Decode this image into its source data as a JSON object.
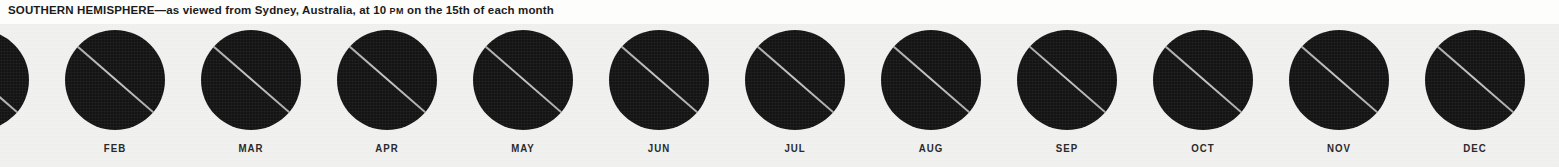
{
  "header": {
    "region_label": "SOUTHERN HEMISPHERE",
    "dash": "—",
    "caption_lead": "SOUTHERN HEMISPHERE—as viewed from Sydney, Australia, at 10 ",
    "caption_smallcaps": "PM",
    "caption_tail": " on the 15th of each month",
    "full_caption": "SOUTHERN HEMISPHERE—as viewed from Sydney, Australia, at 10 PM on the 15th of each month",
    "observer_city": "Sydney, Australia",
    "observation_time": "10 PM",
    "observation_day": "15th of each month"
  },
  "colors": {
    "page_background": "#fdfdfc",
    "field_background": "#f1f1ef",
    "sky_disk": "#141414",
    "galactic_band": "#cdcdcd",
    "label_text": "#2a2a2a",
    "caption_text": "#1b1b1b"
  },
  "charts": {
    "count": 12,
    "disk_diameter_px": 100,
    "cell_pitch_px": 136,
    "months": [
      {
        "label": "JAN",
        "index": 1,
        "clipped": "left"
      },
      {
        "label": "FEB",
        "index": 2,
        "clipped": "none"
      },
      {
        "label": "MAR",
        "index": 3,
        "clipped": "none"
      },
      {
        "label": "APR",
        "index": 4,
        "clipped": "none"
      },
      {
        "label": "MAY",
        "index": 5,
        "clipped": "none"
      },
      {
        "label": "JUN",
        "index": 6,
        "clipped": "none"
      },
      {
        "label": "JUL",
        "index": 7,
        "clipped": "none"
      },
      {
        "label": "AUG",
        "index": 8,
        "clipped": "none"
      },
      {
        "label": "SEP",
        "index": 9,
        "clipped": "none"
      },
      {
        "label": "OCT",
        "index": 10,
        "clipped": "none"
      },
      {
        "label": "NOV",
        "index": 11,
        "clipped": "none"
      },
      {
        "label": "DEC",
        "index": 12,
        "clipped": "right"
      }
    ]
  }
}
